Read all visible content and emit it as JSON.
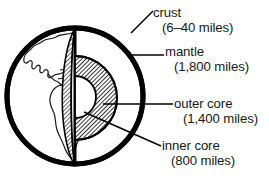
{
  "figure": {
    "background_color": "#ffffff",
    "line_color": "#000000",
    "text_color": "#171717"
  },
  "globe": {
    "landmass_label": "Americas continental outlines",
    "outline_color": "#000000",
    "ocean_fill": "#ffffff",
    "center_x": 75,
    "center_y": 96,
    "radius": 70
  },
  "layers": [
    {
      "key": "crust",
      "name": "crust",
      "depth": "(6–40 miles)",
      "fill_description": "thin black outer shell",
      "fill_color": "#000000"
    },
    {
      "key": "mantle",
      "name": "mantle",
      "depth": "(1,800 miles)",
      "fill_description": "white wedge interior with hatched cut face",
      "fill_color": "#ffffff"
    },
    {
      "key": "outer_core",
      "name": "outer core",
      "depth": "(1,400 miles)",
      "fill_description": "dark diagonal hatch dome",
      "fill_color": "#7d7d7d"
    },
    {
      "key": "inner_core",
      "name": "inner core",
      "depth": "(800 miles)",
      "fill_description": "white circle at center",
      "fill_color": "#ffffff"
    }
  ],
  "callouts": {
    "crust": {
      "name": "crust",
      "depth": "(6–40 miles)"
    },
    "mantle": {
      "name": "mantle",
      "depth": "(1,800 miles)"
    },
    "outer_core": {
      "name": "outer core",
      "depth": "(1,400 miles)"
    },
    "inner_core": {
      "name": "inner core",
      "depth": "(800 miles)"
    }
  },
  "leader_lines": [
    {
      "key": "crust",
      "style": "diagonal",
      "from_x": 131,
      "from_y": 32,
      "to_x": 152,
      "to_y": 10
    },
    {
      "key": "mantle",
      "style": "horizontal",
      "from_x": 132,
      "from_y": 55,
      "to_x": 163,
      "to_y": 55
    },
    {
      "key": "outer_core",
      "style": "horizontal",
      "from_x": 104,
      "from_y": 104,
      "to_x": 172,
      "to_y": 104
    },
    {
      "key": "inner_core",
      "style": "diagonal",
      "from_x": 84,
      "from_y": 112,
      "to_x": 160,
      "to_y": 146
    }
  ]
}
